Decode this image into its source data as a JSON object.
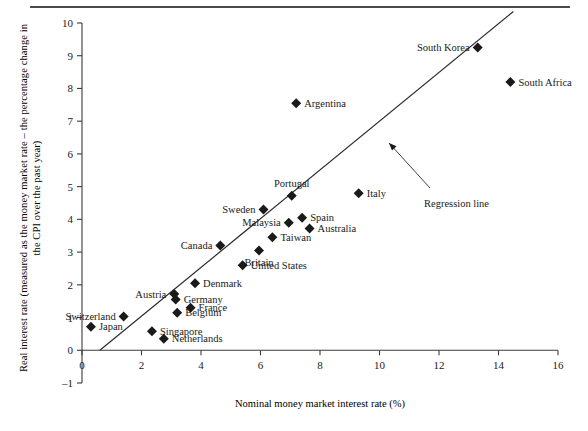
{
  "figure": {
    "has_top_rule": true
  },
  "chart_data": {
    "type": "scatter",
    "title": "",
    "xlabel": "Nominal money market interest rate (%)",
    "ylabel": "Real interest rate (measured as the money market rate – the percentage change in the CPI over the past year)",
    "xlim": [
      0,
      16
    ],
    "ylim": [
      -1,
      10
    ],
    "xticks": [
      0,
      2,
      4,
      6,
      8,
      10,
      12,
      14,
      16
    ],
    "xticklabels": [
      "0",
      "2",
      "4",
      "6",
      "8",
      "10",
      "12",
      "14",
      "16"
    ],
    "yticks": [
      -1,
      0,
      1,
      2,
      3,
      4,
      5,
      6,
      7,
      8,
      9,
      10
    ],
    "yticklabels": [
      "–1",
      "0",
      "1",
      "2",
      "3",
      "4",
      "5",
      "6",
      "7",
      "8",
      "9",
      "10"
    ],
    "grid": false,
    "legend": "none",
    "marker": "diamond",
    "marker_color": "#1a1a1a",
    "points": [
      {
        "label": "Japan",
        "x": 0.3,
        "y": 0.72,
        "label_side": "right"
      },
      {
        "label": "Switzerland",
        "x": 1.4,
        "y": 1.03,
        "label_side": "left"
      },
      {
        "label": "Singapore",
        "x": 2.35,
        "y": 0.58,
        "label_side": "right"
      },
      {
        "label": "Netherlands",
        "x": 2.75,
        "y": 0.35,
        "label_side": "right"
      },
      {
        "label": "Austria",
        "x": 3.1,
        "y": 1.72,
        "label_side": "left"
      },
      {
        "label": "Germany",
        "x": 3.15,
        "y": 1.55,
        "label_side": "right"
      },
      {
        "label": "Belgium",
        "x": 3.2,
        "y": 1.15,
        "label_side": "right"
      },
      {
        "label": "France",
        "x": 3.65,
        "y": 1.3,
        "label_side": "right"
      },
      {
        "label": "Denmark",
        "x": 3.8,
        "y": 2.05,
        "label_side": "right"
      },
      {
        "label": "Canada",
        "x": 4.65,
        "y": 3.2,
        "label_side": "left"
      },
      {
        "label": "United States",
        "x": 5.4,
        "y": 2.6,
        "label_side": "right"
      },
      {
        "label": "Britain",
        "x": 5.95,
        "y": 3.05,
        "label_side": "below"
      },
      {
        "label": "Sweden",
        "x": 6.1,
        "y": 4.3,
        "label_side": "left"
      },
      {
        "label": "Taiwan",
        "x": 6.4,
        "y": 3.45,
        "label_side": "right"
      },
      {
        "label": "Malaysia",
        "x": 6.95,
        "y": 3.9,
        "label_side": "left"
      },
      {
        "label": "Portugal",
        "x": 7.05,
        "y": 4.72,
        "label_side": "above"
      },
      {
        "label": "Argentina",
        "x": 7.2,
        "y": 7.55,
        "label_side": "right"
      },
      {
        "label": "Spain",
        "x": 7.4,
        "y": 4.05,
        "label_side": "right"
      },
      {
        "label": "Australia",
        "x": 7.65,
        "y": 3.72,
        "label_side": "right"
      },
      {
        "label": "Italy",
        "x": 9.3,
        "y": 4.8,
        "label_side": "right"
      },
      {
        "label": "South Korea",
        "x": 13.3,
        "y": 9.25,
        "label_side": "left"
      },
      {
        "label": "South Africa",
        "x": 14.4,
        "y": 8.2,
        "label_side": "right"
      }
    ],
    "regression_line": {
      "label": "Regression line",
      "x_start": 0.6,
      "y_start": 0.0,
      "x_end": 14.5,
      "y_end": 10.35
    }
  }
}
